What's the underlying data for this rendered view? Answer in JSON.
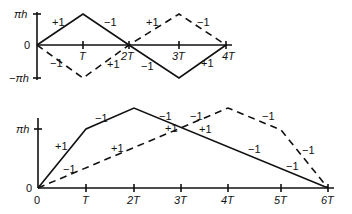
{
  "top_plot": {
    "y_labels": {
      "top": "πh",
      "zero": "0",
      "bottom": "−πh"
    },
    "x_ticks": [
      "T",
      "2T",
      "3T",
      "4T"
    ],
    "solid_labels": [
      "+1",
      "−1",
      "−1",
      "+1"
    ],
    "dashed_labels": [
      "−1",
      "+1",
      "+1",
      "−1"
    ]
  },
  "bottom_plot": {
    "y_labels": {
      "top": "πh",
      "zero": "0"
    },
    "x_ticks": [
      "0",
      "T",
      "2T",
      "3T",
      "4T",
      "5T",
      "6T"
    ],
    "solid_labels": [
      "+1",
      "−1",
      "−1",
      "+1",
      "−1",
      "−1"
    ],
    "dashed_labels": [
      "−1",
      "+1",
      "+1",
      "−1",
      "−1",
      "−1"
    ]
  }
}
